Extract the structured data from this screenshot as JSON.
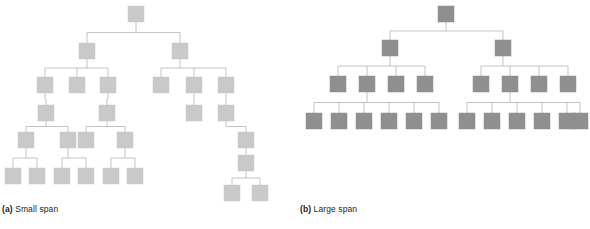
{
  "figure": {
    "background": "#ffffff",
    "edge_color": "#b5b5b5",
    "edge_width": 0.8,
    "node_size": 16,
    "small_span": {
      "label_prefix": "(a)",
      "label_text": " Small span",
      "node_fill": "#c9c9c9",
      "node_stroke": "#c9c9c9",
      "nodes": [
        {
          "id": "a0",
          "x": 128,
          "y": 6,
          "level": 0
        },
        {
          "id": "a1",
          "x": 79,
          "y": 43,
          "level": 1
        },
        {
          "id": "a2",
          "x": 172,
          "y": 43,
          "level": 1
        },
        {
          "id": "a3",
          "x": 37,
          "y": 77,
          "level": 2
        },
        {
          "id": "a4",
          "x": 69,
          "y": 77,
          "level": 2
        },
        {
          "id": "a5",
          "x": 100,
          "y": 77,
          "level": 2
        },
        {
          "id": "a6",
          "x": 153,
          "y": 77,
          "level": 2
        },
        {
          "id": "a7",
          "x": 186,
          "y": 77,
          "level": 2
        },
        {
          "id": "a8",
          "x": 218,
          "y": 77,
          "level": 2
        },
        {
          "id": "a9",
          "x": 38,
          "y": 105,
          "level": 3
        },
        {
          "id": "a10",
          "x": 99,
          "y": 105,
          "level": 3
        },
        {
          "id": "a11",
          "x": 186,
          "y": 105,
          "level": 3
        },
        {
          "id": "a12",
          "x": 218,
          "y": 105,
          "level": 3
        },
        {
          "id": "a13",
          "x": 18,
          "y": 132,
          "level": 4
        },
        {
          "id": "a14",
          "x": 60,
          "y": 132,
          "level": 4
        },
        {
          "id": "a15",
          "x": 78,
          "y": 132,
          "level": 4
        },
        {
          "id": "a16",
          "x": 117,
          "y": 132,
          "level": 4
        },
        {
          "id": "a17",
          "x": 238,
          "y": 132,
          "level": 4
        },
        {
          "id": "a18",
          "x": 5,
          "y": 168,
          "level": 5
        },
        {
          "id": "a19",
          "x": 29,
          "y": 168,
          "level": 5
        },
        {
          "id": "a20",
          "x": 54,
          "y": 168,
          "level": 5
        },
        {
          "id": "a21",
          "x": 78,
          "y": 168,
          "level": 5
        },
        {
          "id": "a22",
          "x": 103,
          "y": 168,
          "level": 5
        },
        {
          "id": "a23",
          "x": 127,
          "y": 168,
          "level": 5
        },
        {
          "id": "a24",
          "x": 238,
          "y": 155,
          "level": 5
        },
        {
          "id": "a25",
          "x": 224,
          "y": 185,
          "level": 6
        },
        {
          "id": "a26",
          "x": 252,
          "y": 185,
          "level": 6
        }
      ],
      "edges": [
        [
          "a0",
          "a1"
        ],
        [
          "a0",
          "a2"
        ],
        [
          "a1",
          "a3"
        ],
        [
          "a1",
          "a4"
        ],
        [
          "a1",
          "a5"
        ],
        [
          "a2",
          "a6"
        ],
        [
          "a2",
          "a7"
        ],
        [
          "a2",
          "a8"
        ],
        [
          "a3",
          "a9"
        ],
        [
          "a5",
          "a10"
        ],
        [
          "a7",
          "a11"
        ],
        [
          "a8",
          "a12"
        ],
        [
          "a9",
          "a13"
        ],
        [
          "a9",
          "a14"
        ],
        [
          "a10",
          "a15"
        ],
        [
          "a10",
          "a16"
        ],
        [
          "a12",
          "a17"
        ],
        [
          "a13",
          "a18"
        ],
        [
          "a13",
          "a19"
        ],
        [
          "a14",
          "a20"
        ],
        [
          "a14",
          "a21"
        ],
        [
          "a16",
          "a22"
        ],
        [
          "a16",
          "a23"
        ],
        [
          "a17",
          "a24"
        ],
        [
          "a24",
          "a25"
        ],
        [
          "a24",
          "a26"
        ]
      ],
      "node_count": 27,
      "depth": 7
    },
    "large_span": {
      "label_prefix": "(b)",
      "label_text": " Large span",
      "node_fill": "#8f8f8f",
      "node_stroke": "#8f8f8f",
      "nodes": [
        {
          "id": "b0",
          "x": 438,
          "y": 6,
          "level": 0
        },
        {
          "id": "b1",
          "x": 382,
          "y": 40,
          "level": 1
        },
        {
          "id": "b2",
          "x": 495,
          "y": 40,
          "level": 1
        },
        {
          "id": "b3",
          "x": 330,
          "y": 76,
          "level": 2
        },
        {
          "id": "b4",
          "x": 359,
          "y": 76,
          "level": 2
        },
        {
          "id": "b5",
          "x": 388,
          "y": 76,
          "level": 2
        },
        {
          "id": "b6",
          "x": 417,
          "y": 76,
          "level": 2
        },
        {
          "id": "b7",
          "x": 473,
          "y": 76,
          "level": 2
        },
        {
          "id": "b8",
          "x": 502,
          "y": 76,
          "level": 2
        },
        {
          "id": "b9",
          "x": 531,
          "y": 76,
          "level": 2
        },
        {
          "id": "b10",
          "x": 560,
          "y": 76,
          "level": 2
        },
        {
          "id": "b11",
          "x": 306,
          "y": 113,
          "level": 3
        },
        {
          "id": "b12",
          "x": 331,
          "y": 113,
          "level": 3
        },
        {
          "id": "b13",
          "x": 356,
          "y": 113,
          "level": 3
        },
        {
          "id": "b14",
          "x": 381,
          "y": 113,
          "level": 3
        },
        {
          "id": "b15",
          "x": 406,
          "y": 113,
          "level": 3
        },
        {
          "id": "b16",
          "x": 431,
          "y": 113,
          "level": 3
        },
        {
          "id": "b17",
          "x": 459,
          "y": 113,
          "level": 3
        },
        {
          "id": "b18",
          "x": 484,
          "y": 113,
          "level": 3
        },
        {
          "id": "b19",
          "x": 509,
          "y": 113,
          "level": 3
        },
        {
          "id": "b20",
          "x": 534,
          "y": 113,
          "level": 3
        },
        {
          "id": "b21",
          "x": 559,
          "y": 113,
          "level": 3
        },
        {
          "id": "b22",
          "x": 572,
          "y": 113,
          "level": 3
        }
      ],
      "edges": [
        [
          "b0",
          "b1"
        ],
        [
          "b0",
          "b2"
        ],
        [
          "b1",
          "b3"
        ],
        [
          "b1",
          "b4"
        ],
        [
          "b1",
          "b5"
        ],
        [
          "b1",
          "b6"
        ],
        [
          "b2",
          "b7"
        ],
        [
          "b2",
          "b8"
        ],
        [
          "b2",
          "b9"
        ],
        [
          "b2",
          "b10"
        ],
        [
          "b4",
          "b11"
        ],
        [
          "b4",
          "b12"
        ],
        [
          "b4",
          "b13"
        ],
        [
          "b4",
          "b14"
        ],
        [
          "b4",
          "b15"
        ],
        [
          "b4",
          "b16"
        ],
        [
          "b8",
          "b17"
        ],
        [
          "b8",
          "b18"
        ],
        [
          "b8",
          "b19"
        ],
        [
          "b8",
          "b20"
        ],
        [
          "b8",
          "b21"
        ],
        [
          "b8",
          "b22"
        ]
      ],
      "node_count": 23,
      "depth": 4
    },
    "main_caption": {
      "prefix": "",
      "text": ""
    }
  }
}
